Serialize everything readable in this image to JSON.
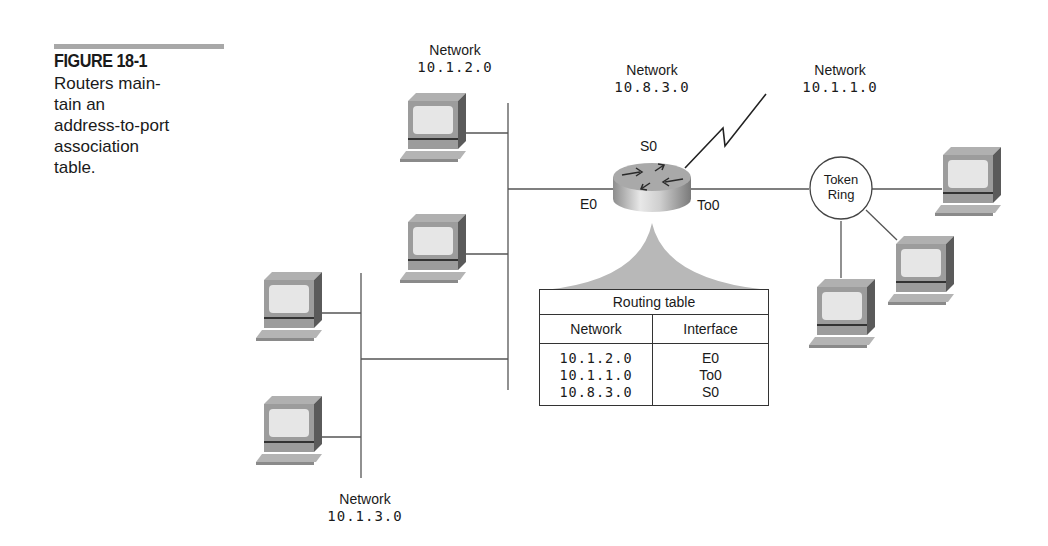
{
  "caption": {
    "figure_label": "FIGURE 18-1",
    "text_lines": [
      "Routers main-",
      "tain an",
      "address-to-port",
      "association",
      "table."
    ]
  },
  "networks": {
    "top_left": {
      "label": "Network",
      "address": "10.1.2.0"
    },
    "serial": {
      "label": "Network",
      "address": "10.8.3.0"
    },
    "token_ring": {
      "label": "Network",
      "address": "10.1.1.0"
    },
    "bottom_left": {
      "label": "Network",
      "address": "10.1.3.0"
    }
  },
  "router": {
    "ports": {
      "serial": "S0",
      "ethernet": "E0",
      "token_ring": "To0"
    }
  },
  "token_ring_node": {
    "line1": "Token",
    "line2": "Ring"
  },
  "routing_table": {
    "title": "Routing table",
    "columns": [
      "Network",
      "Interface"
    ],
    "rows": [
      {
        "network": "10.1.2.0",
        "interface": "E0"
      },
      {
        "network": "10.1.1.0",
        "interface": "To0"
      },
      {
        "network": "10.8.3.0",
        "interface": "S0"
      }
    ]
  },
  "colors": {
    "line": "#555555",
    "computer_body": "#9a9a9a",
    "screen": "#e4e4e4",
    "callout_fill": "#b8b8b8",
    "caption_bar": "#a8a8a8"
  }
}
